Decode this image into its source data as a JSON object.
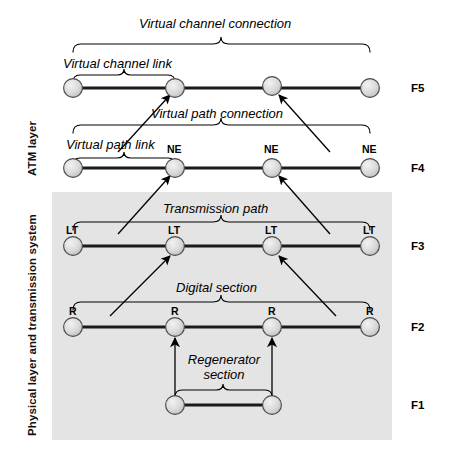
{
  "figure": {
    "background": "#ffffff",
    "shaded_region_color": "#e4e4e4"
  },
  "side_labels": {
    "atm": "ATM layer",
    "physical": "Physical layer and transmission system"
  },
  "level_labels": [
    {
      "id": "F5",
      "text": "F5"
    },
    {
      "id": "F4",
      "text": "F4"
    },
    {
      "id": "F3",
      "text": "F3"
    },
    {
      "id": "F2",
      "text": "F2"
    },
    {
      "id": "F1",
      "text": "F1"
    }
  ],
  "span_labels": [
    {
      "id": "virtual-channel-connection",
      "text": "Virtual channel connection"
    },
    {
      "id": "virtual-channel-link",
      "text": "Virtual channel link"
    },
    {
      "id": "virtual-path-connection",
      "text": "Virtual path connection"
    },
    {
      "id": "virtual-path-link",
      "text": "Virtual path link"
    },
    {
      "id": "transmission-path",
      "text": "Transmission path"
    },
    {
      "id": "digital-section",
      "text": "Digital section"
    },
    {
      "id": "regenerator-section-line1",
      "text": "Regenerator"
    },
    {
      "id": "regenerator-section-line2",
      "text": "section"
    }
  ],
  "rows": [
    {
      "level": "F5",
      "node_labels": [
        "",
        "",
        "",
        ""
      ],
      "nodes_x": [
        73,
        175,
        272,
        370
      ],
      "y": 88
    },
    {
      "level": "F4",
      "node_labels": [
        "",
        "NE",
        "NE",
        "NE"
      ],
      "nodes_x": [
        73,
        175,
        272,
        370
      ],
      "y": 168
    },
    {
      "level": "F3",
      "node_labels": [
        "LT",
        "LT",
        "LT",
        "LT"
      ],
      "nodes_x": [
        73,
        175,
        272,
        370
      ],
      "y": 246
    },
    {
      "level": "F2",
      "node_labels": [
        "R",
        "R",
        "R",
        "R"
      ],
      "nodes_x": [
        73,
        175,
        272,
        370
      ],
      "y": 327
    },
    {
      "level": "F1",
      "node_labels": [
        "",
        ""
      ],
      "nodes_x": [
        175,
        272
      ],
      "y": 405
    }
  ]
}
